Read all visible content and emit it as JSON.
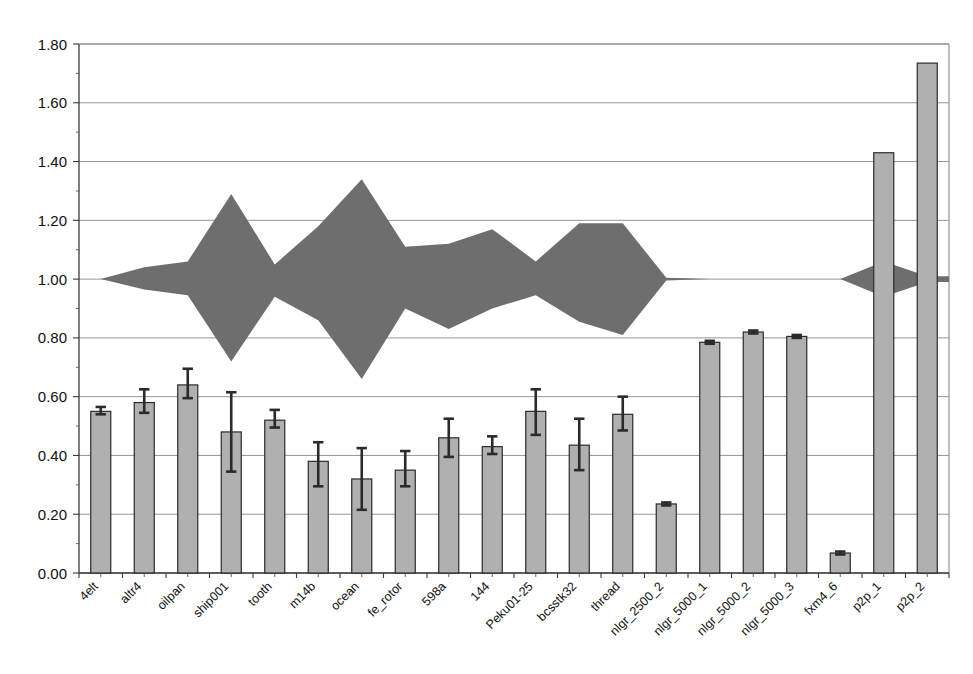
{
  "chart_data": {
    "type": "bar",
    "title": "",
    "subtitle": "",
    "xlabel": "",
    "ylabel": "",
    "ylim": [
      0.0,
      1.8
    ],
    "ytick_labels": [
      "0.00",
      "0.20",
      "0.40",
      "0.60",
      "0.80",
      "1.00",
      "1.20",
      "1.40",
      "1.60",
      "1.80"
    ],
    "ytick_values": [
      0.0,
      0.2,
      0.4,
      0.6,
      0.8,
      1.0,
      1.2,
      1.4,
      1.6,
      1.8
    ],
    "grid": true,
    "legend": "none",
    "categories": [
      "4elt",
      "altr4",
      "oilpan",
      "ship001",
      "tooth",
      "m14b",
      "ocean",
      "fe_rotor",
      "598a",
      "144",
      "Peku01-25",
      "bcsstk32",
      "thread",
      "nlgr_2500_2",
      "nlgr_5000_1",
      "nlgr_5000_2",
      "nlgr_5000_3",
      "fxm4_6",
      "p2p_1",
      "p2p_2"
    ],
    "series": [
      {
        "name": "bar-value",
        "values": [
          0.55,
          0.58,
          0.64,
          0.48,
          0.52,
          0.38,
          0.32,
          0.35,
          0.46,
          0.43,
          0.55,
          0.435,
          0.54,
          0.235,
          0.785,
          0.82,
          0.805,
          0.068,
          1.43,
          1.735
        ]
      },
      {
        "name": "error-upper",
        "values": [
          0.565,
          0.625,
          0.695,
          0.615,
          0.555,
          0.445,
          0.425,
          0.415,
          0.525,
          0.465,
          0.625,
          0.525,
          0.6,
          0.24,
          0.79,
          0.825,
          0.81,
          0.073,
          1.43,
          1.735
        ]
      },
      {
        "name": "error-lower",
        "values": [
          0.54,
          0.545,
          0.595,
          0.345,
          0.495,
          0.295,
          0.215,
          0.295,
          0.395,
          0.405,
          0.47,
          0.35,
          0.485,
          0.23,
          0.78,
          0.815,
          0.8,
          0.063,
          1.43,
          1.735
        ]
      },
      {
        "name": "band-upper",
        "values": [
          1.0,
          1.04,
          1.06,
          1.29,
          1.05,
          1.18,
          1.34,
          1.11,
          1.12,
          1.17,
          1.06,
          1.19,
          1.19,
          1.005,
          1.0,
          1.0,
          1.0,
          1.0,
          1.06,
          1.01
        ]
      },
      {
        "name": "band-lower",
        "values": [
          1.0,
          0.965,
          0.945,
          0.72,
          0.94,
          0.86,
          0.66,
          0.9,
          0.83,
          0.9,
          0.945,
          0.855,
          0.81,
          0.995,
          1.0,
          1.0,
          1.0,
          1.0,
          0.94,
          0.99
        ]
      }
    ],
    "colors": {
      "bar_fill": "#b0b0b0",
      "bar_stroke": "#2b2b2b",
      "band_fill": "#6e6e6e",
      "gridline": "#8a8a8a",
      "axis": "#3a3a3a",
      "background": "#ffffff"
    }
  }
}
